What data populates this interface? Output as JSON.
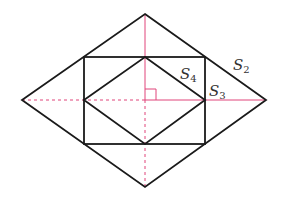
{
  "diagram": {
    "colors": {
      "outline": "#1a1a1a",
      "axis": "#e0457b",
      "label": "#333333",
      "background": "#ffffff"
    },
    "outer_rhombus": {
      "top": [
        145,
        14
      ],
      "right": [
        266,
        100
      ],
      "bottom": [
        145,
        187
      ],
      "left": [
        22,
        100
      ]
    },
    "rectangle": {
      "x1": 84,
      "y1": 57,
      "x2": 205,
      "y2": 144
    },
    "inner_rhombus": {
      "top": [
        145,
        57
      ],
      "right": [
        205,
        100
      ],
      "bottom": [
        145,
        144
      ],
      "left": [
        84,
        100
      ]
    },
    "center": [
      145,
      100
    ],
    "right_angle_marker": {
      "x": 145,
      "y": 89,
      "size": 11
    },
    "labels": [
      {
        "id": "S2",
        "base": "S",
        "sub": "2",
        "x": 233,
        "y": 70
      },
      {
        "id": "S4",
        "base": "S",
        "sub": "4",
        "x": 180,
        "y": 79
      },
      {
        "id": "S3",
        "base": "S",
        "sub": "3",
        "x": 209,
        "y": 96
      }
    ]
  }
}
